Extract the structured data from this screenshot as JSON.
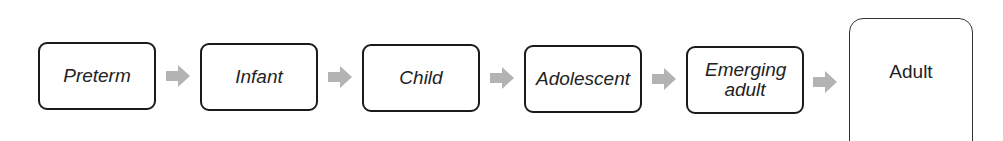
{
  "diagram": {
    "type": "flow",
    "stages": [
      {
        "label": "Preterm"
      },
      {
        "label": "Infant"
      },
      {
        "label": "Child"
      },
      {
        "label": "Adolescent"
      },
      {
        "label": "Emerging adult"
      },
      {
        "label": "Adult"
      }
    ],
    "arrow_icon": "right-arrow-icon",
    "colors": {
      "box_border": "#1a1a1a",
      "arrow": "#b3b3b3",
      "text": "#222222"
    }
  }
}
